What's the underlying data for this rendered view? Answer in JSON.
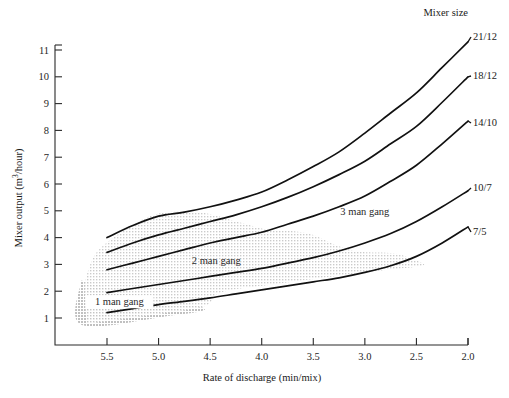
{
  "chart_data": {
    "type": "line",
    "title": "",
    "xlabel": "Rate of discharge (min/mix)",
    "ylabel": "Mixer output (m3/hour)",
    "ylabel_display": "Mixer output (m",
    "ylabel_sup": "3",
    "ylabel_tail": "/hour)",
    "xlim": [
      5.75,
      2.0
    ],
    "ylim": [
      0.55,
      11.4
    ],
    "x_reversed": true,
    "grid": false,
    "legend_position": "right-of-axes",
    "legend_title": "Mixer size",
    "xticks": [
      "5.5",
      "5.0",
      "4.5",
      "4.0",
      "3.5",
      "3.0",
      "2.5",
      "2.0"
    ],
    "xtick_values": [
      5.5,
      5.0,
      4.5,
      4.0,
      3.5,
      3.0,
      2.5,
      2.0
    ],
    "yticks": [
      "1",
      "2",
      "3",
      "4",
      "5",
      "6",
      "7",
      "8",
      "9",
      "10",
      "11"
    ],
    "ytick_values": [
      1,
      2,
      3,
      4,
      5,
      6,
      7,
      8,
      9,
      10,
      11
    ],
    "x": [
      5.5,
      5.25,
      5.0,
      4.75,
      4.5,
      4.25,
      4.0,
      3.75,
      3.5,
      3.25,
      3.0,
      2.75,
      2.5,
      2.25,
      2.0
    ],
    "series": [
      {
        "name": "21/12",
        "label": "21/12",
        "values": [
          4.0,
          4.45,
          4.8,
          4.95,
          5.15,
          5.4,
          5.7,
          6.15,
          6.65,
          7.2,
          7.9,
          8.65,
          9.4,
          10.35,
          11.3
        ]
      },
      {
        "name": "18/12",
        "label": "18/12",
        "values": [
          3.45,
          3.8,
          4.1,
          4.35,
          4.6,
          4.85,
          5.15,
          5.5,
          5.9,
          6.35,
          6.85,
          7.5,
          8.15,
          9.05,
          10.0
        ]
      },
      {
        "name": "14/10",
        "label": "14/10",
        "values": [
          2.8,
          3.05,
          3.3,
          3.55,
          3.8,
          4.0,
          4.2,
          4.5,
          4.8,
          5.15,
          5.55,
          6.1,
          6.7,
          7.5,
          8.35
        ]
      },
      {
        "name": "10/7",
        "label": "10/7",
        "values": [
          1.95,
          2.1,
          2.25,
          2.4,
          2.55,
          2.7,
          2.85,
          3.05,
          3.25,
          3.5,
          3.8,
          4.15,
          4.6,
          5.15,
          5.75
        ]
      },
      {
        "name": "7/5",
        "label": "7/5",
        "values": [
          1.2,
          1.35,
          1.5,
          1.62,
          1.75,
          1.9,
          2.05,
          2.2,
          2.35,
          2.5,
          2.7,
          2.95,
          3.3,
          3.8,
          4.4
        ]
      }
    ],
    "annotations": [
      {
        "text": "1 man gang",
        "x": 5.38,
        "y": 1.55
      },
      {
        "text": "2 man gang",
        "x": 4.44,
        "y": 3.1
      },
      {
        "text": "3 man gang",
        "x": 3.0,
        "y": 4.9
      }
    ],
    "bands": [
      {
        "name": "1-man-gang-band",
        "fill": "#c9c9c9",
        "opacity": 0.85,
        "polygon": [
          [
            5.75,
            2.4
          ],
          [
            5.75,
            0.75
          ],
          [
            4.95,
            1.05
          ],
          [
            4.55,
            1.35
          ],
          [
            5.1,
            1.75
          ]
        ]
      },
      {
        "name": "2-man-gang-band",
        "fill": "#d8d8d8",
        "opacity": 0.8,
        "polygon": [
          [
            5.72,
            2.3
          ],
          [
            5.6,
            3.45
          ],
          [
            5.3,
            4.35
          ],
          [
            5.0,
            4.9
          ],
          [
            4.6,
            4.95
          ],
          [
            4.2,
            4.55
          ],
          [
            3.95,
            4.3
          ],
          [
            3.7,
            4.25
          ],
          [
            3.5,
            4.1
          ],
          [
            3.3,
            3.75
          ],
          [
            3.1,
            3.5
          ],
          [
            2.95,
            3.45
          ],
          [
            2.7,
            3.4
          ],
          [
            2.5,
            3.15
          ],
          [
            2.45,
            2.95
          ],
          [
            2.9,
            2.75
          ],
          [
            3.4,
            2.5
          ],
          [
            3.9,
            2.25
          ],
          [
            4.4,
            1.95
          ],
          [
            4.55,
            1.45
          ],
          [
            5.0,
            1.15
          ],
          [
            5.7,
            0.78
          ]
        ]
      }
    ],
    "colors": {
      "curve": "#111111",
      "axis": "#2b2b2b",
      "band_light": "#d8d8d8",
      "band_dark": "#c9c9c9",
      "background": "#ffffff"
    }
  }
}
